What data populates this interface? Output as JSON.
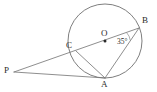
{
  "figure": {
    "type": "circle-geometry-diagram",
    "canvas": {
      "width": 157,
      "height": 92,
      "background": "#ffffff"
    },
    "stroke_color": "#7a7a7a",
    "circle_color": "#6f6f6f",
    "label_color": "#2b2b2b",
    "circle": {
      "center_label": "O",
      "cx": 105,
      "cy": 41,
      "r": 37
    },
    "points": [
      {
        "name": "P",
        "label": "P",
        "x": 14,
        "y": 72,
        "label_x": 4,
        "label_y": 66,
        "on_circle": false
      },
      {
        "name": "C",
        "label": "C",
        "x": 76,
        "y": 51,
        "label_x": 66,
        "label_y": 41,
        "on_circle": true
      },
      {
        "name": "A",
        "label": "A",
        "x": 105,
        "y": 78,
        "label_x": 101,
        "label_y": 80,
        "on_circle": true
      },
      {
        "name": "B",
        "label": "B",
        "x": 139,
        "y": 28,
        "label_x": 142,
        "label_y": 16,
        "on_circle": true
      },
      {
        "name": "O",
        "label": "O",
        "x": 105,
        "y": 41,
        "label_x": 101,
        "label_y": 29,
        "on_circle": false
      }
    ],
    "segments": [
      {
        "name": "secant-P-to-B",
        "from": "P",
        "to": "B"
      },
      {
        "name": "line-P-to-A",
        "from": "P",
        "to": "A"
      },
      {
        "name": "chord-A-to-B",
        "from": "A",
        "to": "B"
      },
      {
        "name": "chord-A-to-C",
        "from": "A",
        "to": "C"
      }
    ],
    "angles": [
      {
        "name": "angle-at-B",
        "vertex": "B",
        "value": "35",
        "unit": "°",
        "text": "35°",
        "label_x": 117,
        "label_y": 38
      }
    ]
  }
}
